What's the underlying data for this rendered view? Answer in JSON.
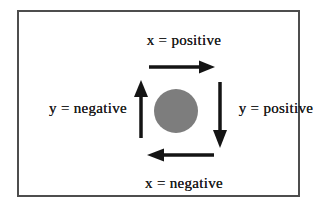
{
  "diagram": {
    "labels": {
      "top": "x = positive",
      "right": "y = positive",
      "bottom": "x = negative",
      "left": "y = negative"
    },
    "icons": {
      "top": "arrow-right-icon",
      "right": "arrow-down-icon",
      "bottom": "arrow-left-icon",
      "left": "arrow-up-icon",
      "center": "filled-circle"
    },
    "colors": {
      "background": "#ffffff",
      "frame_border": "#4d4d4d",
      "text": "#1c1c1c",
      "arrow": "#141414",
      "circle_fill": "#7d7d7d"
    }
  }
}
